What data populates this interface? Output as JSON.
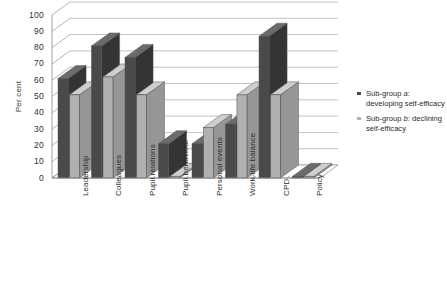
{
  "chart_data": {
    "type": "bar",
    "title": "",
    "subtitle": "",
    "xlabel": "",
    "ylabel": "Per cent",
    "ylim": [
      0,
      100
    ],
    "ytick_step": 10,
    "yticks": [
      "0",
      "10",
      "20",
      "30",
      "40",
      "50",
      "60",
      "70",
      "80",
      "90",
      "100"
    ],
    "grid": true,
    "style": "3-D clustered column, greyscale",
    "legend_position": "right",
    "categories": [
      "Leadership",
      "Colleagues",
      "Pupil relations",
      "Pupil behaviour",
      "Personal events",
      "Work-life balance",
      "CPD",
      "Policy"
    ],
    "series": [
      {
        "name": "Sub-group a: developing self-efficacy",
        "name_prefix": "Sub-group ",
        "name_italic": "a",
        "name_suffix": ": developing self-efficacy",
        "color": "#4a4a4a",
        "values": [
          61,
          81,
          74,
          21,
          21,
          33,
          87,
          1
        ]
      },
      {
        "name": "Sub-group b: declining self-efficacy",
        "name_prefix": "Sub-group ",
        "name_italic": "b",
        "name_suffix": ": declining self-efficacy",
        "color": "#b0b0b0",
        "values": [
          51,
          62,
          51,
          1,
          31,
          51,
          51,
          1
        ]
      }
    ]
  },
  "colors": {
    "series_a": "#4a4a4a",
    "series_a_top": "#6b6b6b",
    "series_a_side": "#343434",
    "series_b": "#b0b0b0",
    "series_b_top": "#cecece",
    "series_b_side": "#969696",
    "grid": "#9a9a9a",
    "axis": "#8a8a8a",
    "floor": "#fdfdfd",
    "text": "#2f2f2f",
    "background": "#ffffff"
  },
  "legend": {
    "entries": [
      {
        "prefix": "Sub-group ",
        "italic": "a",
        "suffix": ": developing self-efficacy",
        "swatch": "#4a4a4a"
      },
      {
        "prefix": "Sub-group ",
        "italic": "b",
        "suffix": ": declining self-efficacy",
        "swatch": "#b0b0b0"
      }
    ]
  }
}
